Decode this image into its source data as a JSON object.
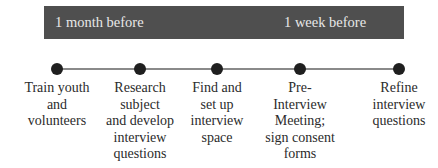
{
  "timeline": {
    "bar": {
      "color": "#4f4f4f",
      "text_color": "#e8e8e8",
      "labels": [
        "1 month before",
        "1 week before"
      ]
    },
    "steps": [
      {
        "x": 57,
        "label": "Train youth\nand\nvolunteers"
      },
      {
        "x": 140,
        "label": "Research\nsubject\nand develop\ninterview\nquestions"
      },
      {
        "x": 217,
        "label": "Find and\nset up\ninterview\nspace"
      },
      {
        "x": 300,
        "label": "Pre-\nInterview\nMeeting;\nsign consent\nforms"
      },
      {
        "x": 399,
        "label": "Refine\ninterview\nquestions"
      }
    ]
  }
}
